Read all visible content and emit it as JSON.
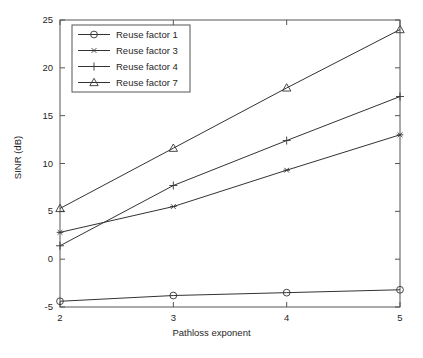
{
  "chart_data": {
    "type": "line",
    "title": "",
    "xlabel": "Pathloss exponent",
    "ylabel": "SINR (dB)",
    "x": [
      2,
      3,
      4,
      5
    ],
    "xlim": [
      2,
      5
    ],
    "ylim": [
      -5,
      25
    ],
    "xticks": [
      "2",
      "3",
      "4",
      "5"
    ],
    "yticks": [
      "25",
      "20",
      "15",
      "10",
      "5",
      "0",
      "-5"
    ],
    "ytick_values": [
      25,
      20,
      15,
      10,
      5,
      0,
      -5
    ],
    "grid": false,
    "legend_position": "upper left",
    "series": [
      {
        "name": "Reuse factor 1",
        "marker": "circle",
        "values": [
          -4.4,
          -3.8,
          -3.5,
          -3.2
        ],
        "color": "#333333"
      },
      {
        "name": "Reuse factor 3",
        "marker": "asterisk",
        "values": [
          2.8,
          5.5,
          9.3,
          13.0
        ],
        "color": "#333333"
      },
      {
        "name": "Reuse factor 4",
        "marker": "plus",
        "values": [
          1.4,
          7.7,
          12.4,
          17.0
        ],
        "color": "#333333"
      },
      {
        "name": "Reuse factor 7",
        "marker": "triangle",
        "values": [
          5.3,
          11.6,
          17.9,
          24.0
        ],
        "color": "#333333"
      }
    ]
  },
  "axes": {
    "frame_color": "#555555",
    "background": "#ffffff"
  },
  "legend": {
    "entries": [
      {
        "label": "Reuse factor 1"
      },
      {
        "label": "Reuse factor 3"
      },
      {
        "label": "Reuse factor 4"
      },
      {
        "label": "Reuse factor 7"
      }
    ]
  }
}
